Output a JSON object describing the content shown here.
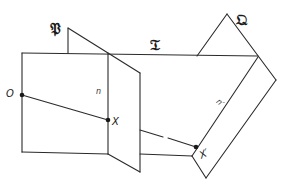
{
  "diagram": {
    "planes": [
      {
        "id": "P",
        "label": "𝔓"
      },
      {
        "id": "T",
        "label": "𝔗"
      },
      {
        "id": "Q",
        "label": "𝔔"
      }
    ],
    "lines": [
      {
        "id": "n",
        "label": "n"
      },
      {
        "id": "n_prime",
        "label": "n′"
      }
    ],
    "points": [
      {
        "id": "O",
        "label": "O"
      },
      {
        "id": "X",
        "label": "X"
      },
      {
        "id": "X_prime",
        "label": "X′"
      }
    ]
  }
}
